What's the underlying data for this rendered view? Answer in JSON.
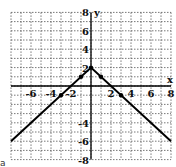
{
  "chart_data": {
    "type": "line",
    "title": "",
    "xlabel": "x",
    "ylabel": "y",
    "xlim": [
      -8,
      8
    ],
    "ylim": [
      -8,
      8
    ],
    "grid": true,
    "x_ticks": [
      -6,
      -4,
      -2,
      2,
      4,
      6,
      8
    ],
    "y_ticks": [
      8,
      6,
      4,
      2,
      -4,
      -6,
      -8
    ],
    "series": [
      {
        "name": "y = -|x| + 2",
        "x": [
          -8,
          0,
          8
        ],
        "y": [
          -6,
          2,
          -6
        ]
      }
    ],
    "marked_points": [
      {
        "x": -3,
        "y": -1
      },
      {
        "x": -1,
        "y": 1
      },
      {
        "x": 0,
        "y": 2
      },
      {
        "x": 1,
        "y": 1
      },
      {
        "x": 3,
        "y": -1
      }
    ],
    "colors": {
      "line": "#000000",
      "grid": "#555555",
      "axis": "#000000"
    }
  },
  "corner_label": "a"
}
